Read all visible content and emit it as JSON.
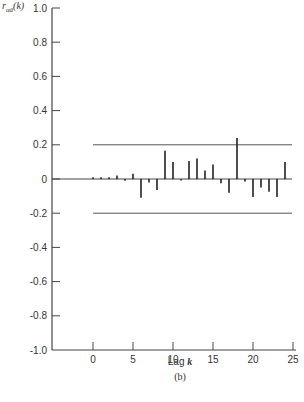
{
  "chart_data": {
    "type": "bar",
    "subtype": "autocorrelation stem plot",
    "title": "",
    "ylabel": "r_αâ(k)",
    "ylabel_main": "r",
    "ylabel_sub": "αâ",
    "ylabel_arg": "(k)",
    "xlabel": "Lag k",
    "xlabel_prefix": "Lag",
    "xlabel_var": "k",
    "panel_label": "(b)",
    "ylim": [
      -1.0,
      1.0
    ],
    "xlim": [
      -4,
      25
    ],
    "yticks": [
      1.0,
      0.8,
      0.6,
      0.4,
      0.2,
      0,
      -0.2,
      -0.4,
      -0.6,
      -0.8,
      -1.0
    ],
    "ytick_labels": [
      "1.0",
      "0.8",
      "0.6",
      "0.4",
      "0.2",
      "0",
      "-0.2",
      "-0.4",
      "-0.6",
      "-0.8",
      "-1.0"
    ],
    "xticks": [
      0,
      5,
      10,
      15,
      20,
      25
    ],
    "xtick_labels": [
      "0",
      "5",
      "10",
      "15",
      "20",
      "25"
    ],
    "grid": false,
    "confidence_limits": [
      0.2,
      -0.2
    ],
    "x": [
      0,
      1,
      2,
      3,
      4,
      5,
      6,
      7,
      8,
      9,
      10,
      11,
      12,
      13,
      14,
      15,
      16,
      17,
      18,
      19,
      20,
      21,
      22,
      23,
      24
    ],
    "values": [
      0.01,
      0.01,
      0.01,
      0.02,
      -0.01,
      0.03,
      -0.11,
      -0.02,
      -0.065,
      0.165,
      0.1,
      -0.005,
      0.105,
      0.12,
      0.05,
      0.085,
      -0.025,
      -0.08,
      0.24,
      -0.015,
      -0.105,
      -0.05,
      -0.075,
      -0.105,
      0.1
    ]
  }
}
